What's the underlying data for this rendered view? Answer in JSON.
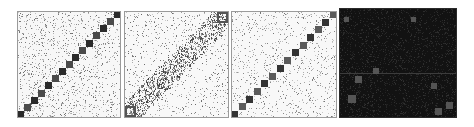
{
  "figure": {
    "description": "Four adjacency-matrix style plots with noisy background and block-diagonal structure",
    "background": "#ffffff"
  },
  "chart_data": [
    {
      "type": "heatmap",
      "title": "",
      "panel": 1,
      "box": {
        "x": 17,
        "y": 11,
        "w": 104,
        "h": 107
      },
      "background_color": "#f7f7f7",
      "noise_color": "#505050",
      "noise_density": 0.22,
      "diagonal": {
        "direction": "bottom-left-to-top-right",
        "blocks": 15,
        "block_colors": [
          "#2a2a2a",
          "#4a4a4a"
        ],
        "block_size": 7
      },
      "grid": false,
      "legend": null
    },
    {
      "type": "heatmap",
      "title": "",
      "panel": 2,
      "box": {
        "x": 124,
        "y": 11,
        "w": 105,
        "h": 107
      },
      "background_color": "#f8f8f8",
      "noise_color": "#4a4a4a",
      "noise_density": 0.14,
      "diagonal": {
        "direction": "bottom-left-to-top-right",
        "band": true,
        "band_width": 22,
        "band_density": 0.45,
        "corner_blocks": 2,
        "block_colors": [
          "#555555"
        ],
        "block_size": 9
      },
      "grid": false,
      "legend": null
    },
    {
      "type": "heatmap",
      "title": "",
      "panel": 3,
      "box": {
        "x": 231,
        "y": 11,
        "w": 106,
        "h": 107
      },
      "background_color": "#f8f8f8",
      "noise_color": "#5a5a5a",
      "noise_density": 0.16,
      "diagonal": {
        "direction": "bottom-left-to-top-right",
        "blocks": 14,
        "block_colors": [
          "#333333",
          "#5a5a5a"
        ],
        "block_size": 7
      },
      "grid": false,
      "legend": null
    },
    {
      "type": "heatmap",
      "title": "",
      "panel": 4,
      "box": {
        "x": 339,
        "y": 8,
        "w": 118,
        "h": 110
      },
      "background_color": "#121212",
      "noise_color": "#3a3a3a",
      "noise_density": 0.3,
      "horizontal_line_y": 65,
      "scattered_blocks": [
        {
          "x": 5,
          "y": 9,
          "s": 5
        },
        {
          "x": 72,
          "y": 9,
          "s": 5
        },
        {
          "x": 34,
          "y": 60,
          "s": 6
        },
        {
          "x": 16,
          "y": 68,
          "s": 7
        },
        {
          "x": 92,
          "y": 75,
          "s": 6
        },
        {
          "x": 9,
          "y": 87,
          "s": 8
        },
        {
          "x": 107,
          "y": 94,
          "s": 7
        },
        {
          "x": 96,
          "y": 100,
          "s": 7
        }
      ],
      "scattered_block_color": "#555555",
      "grid": false,
      "legend": null
    }
  ]
}
